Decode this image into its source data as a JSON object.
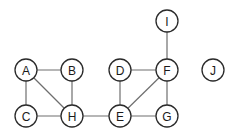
{
  "graph": {
    "nodes": [
      {
        "id": "A",
        "label": "A",
        "x": 26,
        "y": 70
      },
      {
        "id": "B",
        "label": "B",
        "x": 72,
        "y": 70
      },
      {
        "id": "C",
        "label": "C",
        "x": 26,
        "y": 116
      },
      {
        "id": "H",
        "label": "H",
        "x": 72,
        "y": 116
      },
      {
        "id": "D",
        "label": "D",
        "x": 120,
        "y": 70
      },
      {
        "id": "F",
        "label": "F",
        "x": 167,
        "y": 70
      },
      {
        "id": "I",
        "label": "I",
        "x": 167,
        "y": 21
      },
      {
        "id": "E",
        "label": "E",
        "x": 120,
        "y": 116
      },
      {
        "id": "G",
        "label": "G",
        "x": 167,
        "y": 116
      },
      {
        "id": "J",
        "label": "J",
        "x": 213,
        "y": 70
      }
    ],
    "edges": [
      [
        "A",
        "B"
      ],
      [
        "A",
        "C"
      ],
      [
        "A",
        "H"
      ],
      [
        "B",
        "H"
      ],
      [
        "C",
        "H"
      ],
      [
        "H",
        "E"
      ],
      [
        "D",
        "F"
      ],
      [
        "D",
        "E"
      ],
      [
        "E",
        "F"
      ],
      [
        "E",
        "G"
      ],
      [
        "F",
        "G"
      ],
      [
        "I",
        "F"
      ]
    ],
    "node_radius": 11
  }
}
